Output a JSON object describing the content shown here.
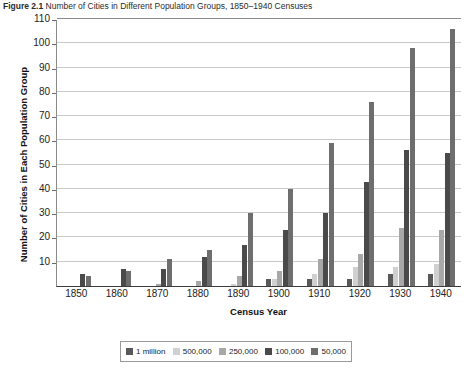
{
  "figure": {
    "number": "Figure 2.1",
    "title": "Number of Cities in Different Population Groups, 1850–1940 Censuses"
  },
  "chart_data": {
    "type": "bar",
    "title": "Number of Cities in Different Population Groups, 1850–1940 Censuses",
    "xlabel": "Census Year",
    "ylabel": "Number of Cities in Each Population Group",
    "categories": [
      "1850",
      "1860",
      "1870",
      "1880",
      "1890",
      "1900",
      "1910",
      "1920",
      "1930",
      "1940"
    ],
    "ylim": [
      0,
      110
    ],
    "ytick_step": 10,
    "yticks": [
      0,
      10,
      20,
      30,
      40,
      50,
      60,
      70,
      80,
      90,
      100,
      110
    ],
    "grid": true,
    "legend_position": "bottom",
    "series": [
      {
        "name": "1 million",
        "color": "#595959",
        "values": [
          0,
          0,
          0,
          0,
          0,
          3,
          3,
          3,
          5,
          5
        ]
      },
      {
        "name": "500,000",
        "color": "#d0d0d0",
        "values": [
          0,
          0,
          0,
          0,
          1,
          3,
          5,
          8,
          8,
          9
        ]
      },
      {
        "name": "250,000",
        "color": "#a8a8a8",
        "values": [
          0,
          0,
          1,
          2,
          4,
          6,
          11,
          13,
          24,
          23
        ]
      },
      {
        "name": "100,000",
        "color": "#4a4a4a",
        "values": [
          5,
          7,
          7,
          12,
          17,
          23,
          30,
          43,
          56,
          55
        ]
      },
      {
        "name": "50,000",
        "color": "#6e6e6e",
        "values": [
          4,
          6,
          11,
          15,
          30,
          40,
          59,
          76,
          98,
          106
        ]
      }
    ]
  },
  "legend": {
    "items": [
      {
        "label": "1 million",
        "color": "#595959"
      },
      {
        "label": "500,000",
        "color": "#d0d0d0"
      },
      {
        "label": "250,000",
        "color": "#a8a8a8"
      },
      {
        "label": "100,000",
        "color": "#4a4a4a"
      },
      {
        "label": "50,000",
        "color": "#6e6e6e"
      }
    ]
  }
}
